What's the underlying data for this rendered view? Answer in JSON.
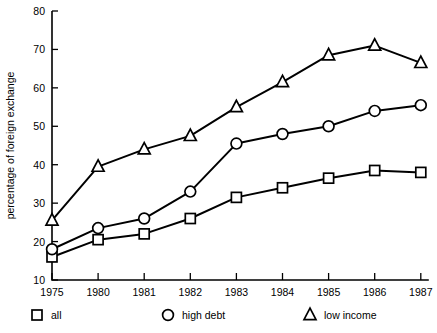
{
  "chart_data": {
    "type": "line",
    "title": "",
    "xlabel": "",
    "ylabel": "percentage of foreign exchange",
    "categories": [
      "1975",
      "1980",
      "1981",
      "1982",
      "1983",
      "1984",
      "1985",
      "1986",
      "1987"
    ],
    "ylim": [
      10,
      80
    ],
    "ytick_labels": [
      "10",
      "20",
      "30",
      "40",
      "50",
      "60",
      "70",
      "80"
    ],
    "yticks": [
      10,
      20,
      30,
      40,
      50,
      60,
      70,
      80
    ],
    "grid": false,
    "legend_position": "bottom",
    "series": [
      {
        "name": "all",
        "marker": "square",
        "values": [
          16,
          20.5,
          22,
          26,
          31.5,
          34,
          36.5,
          38.5,
          38
        ]
      },
      {
        "name": "high debt",
        "marker": "circle",
        "values": [
          18,
          23.5,
          26,
          33,
          45.5,
          48,
          50,
          54,
          55.5
        ]
      },
      {
        "name": "low income",
        "marker": "triangle",
        "values": [
          25.5,
          39.5,
          44,
          47.5,
          55,
          61.5,
          68.5,
          71,
          66.5
        ]
      }
    ]
  },
  "legend": {
    "items": [
      {
        "label": "all",
        "marker": "square"
      },
      {
        "label": "high debt",
        "marker": "circle"
      },
      {
        "label": "low income",
        "marker": "triangle"
      }
    ]
  }
}
